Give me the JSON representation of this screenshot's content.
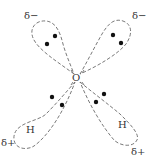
{
  "diagram": {
    "center_atom": {
      "label": "O"
    },
    "lobes": [
      {
        "id": "top-left",
        "type": "lone-pair",
        "charge": "δ−",
        "electrons": 2
      },
      {
        "id": "top-right",
        "type": "lone-pair",
        "charge": "δ−",
        "electrons": 2
      },
      {
        "id": "bottom-left",
        "type": "bonding-pair",
        "atom": "H",
        "charge": "δ+",
        "electrons": 2
      },
      {
        "id": "bottom-right",
        "type": "bonding-pair",
        "atom": "H",
        "charge": "δ+",
        "electrons": 2
      }
    ],
    "colors": {
      "line": "#666666",
      "dot": "#111111",
      "text": "#333333"
    }
  }
}
